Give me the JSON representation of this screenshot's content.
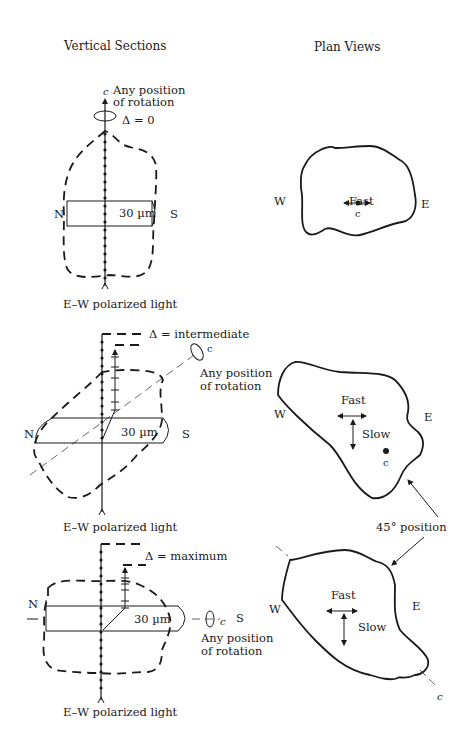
{
  "headers": {
    "left": "Vertical Sections",
    "right": "Plan Views"
  },
  "panels": [
    {
      "axis_label": "c",
      "rotation_label_line1": "Any position",
      "rotation_label_line2": "of rotation",
      "retardation": "Δ = 0",
      "north": "N",
      "south": "S",
      "thickness": "30 µm",
      "light": "E–W polarized light",
      "plan": {
        "west": "W",
        "east": "E",
        "fast": "Fast",
        "axis": "c"
      }
    },
    {
      "axis_label": "c",
      "rotation_label_line1": "Any position",
      "rotation_label_line2": "of rotation",
      "retardation": "Δ = intermediate",
      "north": "N",
      "south": "S",
      "thickness": "30 µm",
      "light": "E–W polarized light",
      "plan": {
        "west": "W",
        "east": "E",
        "fast": "Fast",
        "slow": "Slow",
        "axis": "c"
      }
    },
    {
      "axis_label": "c",
      "rotation_label_line1": "Any position",
      "rotation_label_line2": "of rotation",
      "retardation": "Δ = maximum",
      "north": "N",
      "south": "S",
      "thickness": "30 µm",
      "light": "E–W polarized light",
      "plan": {
        "west": "W",
        "east": "E",
        "fast": "Fast",
        "slow": "Slow",
        "axis": "c"
      }
    }
  ],
  "callout": "45° position"
}
